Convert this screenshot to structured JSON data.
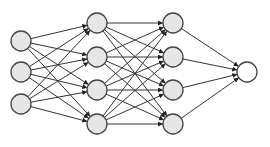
{
  "diagram": {
    "type": "feedforward-neural-network",
    "colors": {
      "background": "#ffffff",
      "edge": "#333333",
      "node_stroke": "#444444",
      "hidden_fill": "#e6e6e6",
      "output_fill": "#ffffff"
    },
    "node_radius": 10,
    "layers": [
      {
        "name": "input",
        "x": 21,
        "fill": "#e6e6e6",
        "nodes_y": [
          41,
          72,
          104
        ]
      },
      {
        "name": "hidden-1",
        "x": 97,
        "fill": "#e6e6e6",
        "nodes_y": [
          23,
          57,
          90,
          124
        ]
      },
      {
        "name": "hidden-2",
        "x": 173,
        "fill": "#e6e6e6",
        "nodes_y": [
          23,
          57,
          90,
          124
        ]
      },
      {
        "name": "output",
        "x": 247,
        "fill": "#ffffff",
        "nodes_y": [
          72
        ]
      }
    ],
    "connectivity": "fully-connected",
    "edge_arrowheads": true
  }
}
